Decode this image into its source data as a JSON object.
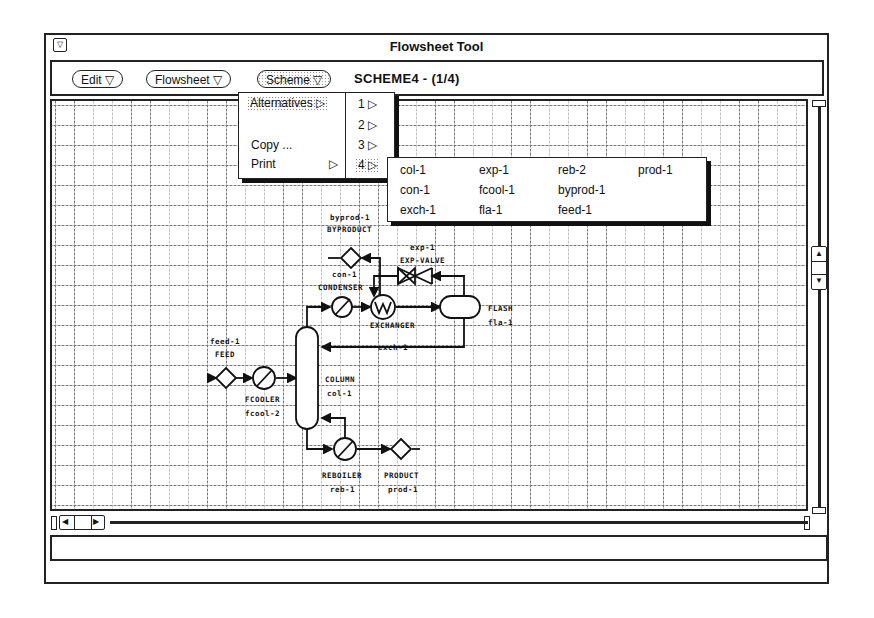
{
  "window": {
    "title": "Flowsheet Tool",
    "window_menu_icon": "triangle-down"
  },
  "toolbar": {
    "buttons": [
      {
        "label": "Edit ▽"
      },
      {
        "label": "Flowsheet ▽"
      },
      {
        "label": "Scheme ▽",
        "active": true
      }
    ],
    "scheme_label": "SCHEME4 - (1/4)"
  },
  "scheme_menu": {
    "items": [
      {
        "label": "Alternatives ▷",
        "highlighted": true
      },
      {
        "label": "Copy ..."
      },
      {
        "label": "Print",
        "arrow": "▷"
      }
    ]
  },
  "alternatives_menu": {
    "items": [
      {
        "label": "1 ▷"
      },
      {
        "label": "2 ▷"
      },
      {
        "label": "3 ▷"
      },
      {
        "label": "4 ▷",
        "highlighted": true
      }
    ]
  },
  "units_menu": {
    "columns": [
      [
        "col-1",
        "con-1",
        "exch-1"
      ],
      [
        "exp-1",
        "fcool-1",
        "fla-1"
      ],
      [
        "reb-2",
        "byprod-1",
        "feed-1"
      ],
      [
        "prod-1"
      ]
    ]
  },
  "diagram": {
    "labels": {
      "byprod_id": "byprod-1",
      "byproduct": "BYPRODUCT",
      "con_id": "con-1",
      "condenser": "CONDENSER",
      "exp_id": "exp-1",
      "exp_valve": "EXP-VALVE",
      "exchanger": "EXCHANGER",
      "flash": "FLASH",
      "fla_id": "fla-1",
      "exch_id": "exch-1",
      "feed_id": "feed-1",
      "feed": "FEED",
      "fcooler": "FCOOLER",
      "fcool_id": "fcool-2",
      "column": "COLUMN",
      "col_id": "col-1",
      "reboiler": "REBOILER",
      "reb_id": "reb-1",
      "product": "PRODUCT",
      "prod_id": "prod-1"
    }
  },
  "status_bar": {
    "text": ""
  }
}
